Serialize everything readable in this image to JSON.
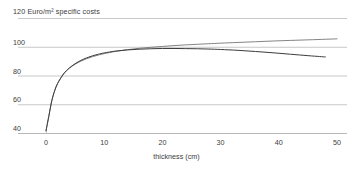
{
  "chart_data": {
    "type": "line",
    "title": "",
    "top_axis_annotation": "120 Euro/m² specific costs",
    "xlabel": "thickness (cm)",
    "ylabel": "Euro/m² specific costs",
    "xlim": [
      -1,
      51
    ],
    "ylim": [
      40,
      120
    ],
    "xticks": [
      0,
      10,
      20,
      30,
      40,
      50
    ],
    "xtick_labels": [
      "0",
      "10",
      "20",
      "30",
      "40",
      "50"
    ],
    "yticks": [
      40,
      60,
      80,
      100,
      120
    ],
    "ytick_labels": [
      "40",
      "60",
      "80",
      "100",
      "120"
    ],
    "grid": true,
    "grid_color": "#b0b0b0",
    "legend": "none",
    "line_color": "#4a4a4a",
    "series": [
      {
        "name": "upper curve",
        "color": "#6e6e6e",
        "x": [
          0,
          0.5,
          1,
          1.5,
          2,
          3,
          4,
          5,
          6,
          7,
          8,
          9,
          10,
          12,
          14,
          16,
          18,
          20,
          22,
          24,
          26,
          28,
          30,
          33,
          36,
          39,
          42,
          45,
          48,
          50
        ],
        "values": [
          41.5,
          52,
          62.5,
          69.5,
          74.5,
          81.0,
          85.0,
          87.8,
          90.0,
          91.7,
          93.1,
          94.2,
          95.2,
          96.8,
          98.0,
          98.9,
          99.6,
          100.2,
          100.8,
          101.3,
          101.7,
          102.1,
          102.5,
          103.0,
          103.5,
          104.0,
          104.4,
          104.8,
          105.2,
          105.5
        ]
      },
      {
        "name": "lower curve",
        "color": "#3c3c3c",
        "x": [
          0,
          0.5,
          1,
          1.5,
          2,
          3,
          4,
          5,
          6,
          7,
          8,
          9,
          10,
          12,
          14,
          16,
          18,
          20,
          22,
          24,
          26,
          28,
          30,
          33,
          36,
          39,
          42,
          45,
          47,
          48
        ],
        "values": [
          41.5,
          52,
          62.5,
          69.5,
          74.5,
          81.0,
          85.2,
          88.2,
          90.5,
          92.3,
          93.7,
          94.8,
          95.7,
          97.0,
          97.8,
          98.3,
          98.6,
          98.8,
          98.8,
          98.7,
          98.6,
          98.4,
          98.1,
          97.5,
          96.7,
          95.8,
          94.8,
          93.8,
          93.2,
          92.9
        ]
      }
    ]
  }
}
